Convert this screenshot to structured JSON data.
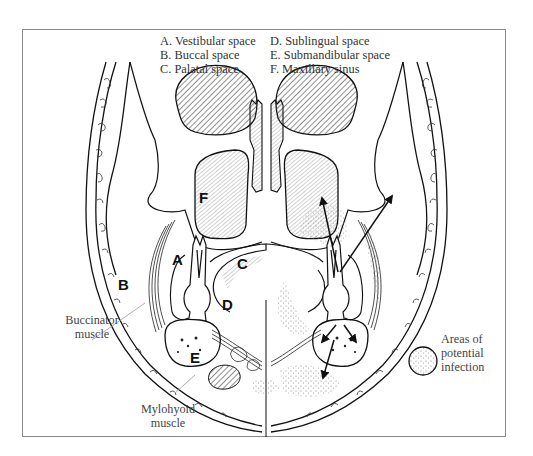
{
  "figure": {
    "legend": {
      "items": [
        {
          "key": "A",
          "text": "A. Vestibular space"
        },
        {
          "key": "B",
          "text": "B. Buccal space"
        },
        {
          "key": "C",
          "text": "C. Palatal space"
        },
        {
          "key": "D",
          "text": "D. Sublingual space"
        },
        {
          "key": "E",
          "text": "E. Submandibular space"
        },
        {
          "key": "F",
          "text": "F. Maxillary sinus"
        }
      ]
    },
    "region_letters": {
      "A": "A",
      "B": "B",
      "C": "C",
      "D": "D",
      "E": "E",
      "F": "F"
    },
    "callouts": {
      "buccinator": {
        "line1": "Buccinator",
        "line2": "muscle"
      },
      "mylohyoid": {
        "line1": "Mylohyoid",
        "line2": "muscle"
      },
      "infection_key": {
        "line1": "Areas of",
        "line2": "potential",
        "line3": "infection"
      }
    },
    "colors": {
      "ink": "#111111",
      "frame": "#8a8a8a",
      "leader": "#9a9a9a",
      "stipple": "#777777"
    }
  }
}
